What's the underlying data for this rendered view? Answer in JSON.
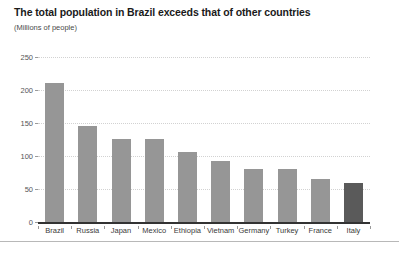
{
  "chart_data": {
    "type": "bar",
    "title": "The total population in Brazil exceeds that of other countries",
    "subtitle": "(Millions of people)",
    "xlabel": "",
    "ylabel": "",
    "categories": [
      "Brazil",
      "Russia",
      "Japan",
      "Mexico",
      "Ethiopia",
      "Vietnam",
      "Germany",
      "Turkey",
      "France",
      "Italy"
    ],
    "values": [
      210,
      145,
      126,
      126,
      106,
      93,
      80,
      80,
      65,
      59
    ],
    "ylim": [
      0,
      250
    ],
    "yticks": [
      0,
      50,
      100,
      150,
      200,
      250
    ],
    "ytick_labels": [
      "0",
      "50",
      "100",
      "150",
      "200",
      "250"
    ],
    "grid": true,
    "grid_axis": "y",
    "legend": false,
    "bar_color": "#969696",
    "highlight_color": "#5a5a5a",
    "highlight_categories": [
      "Italy"
    ],
    "grid_color": "#d2d2d2",
    "axis_color": "#333333",
    "background": "#ffffff"
  }
}
